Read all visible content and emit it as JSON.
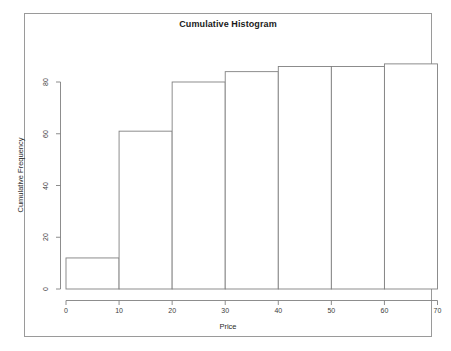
{
  "chart_data": {
    "type": "bar",
    "title": "Cumulative Histogram",
    "xlabel": "Price",
    "ylabel": "Cumulative Frequency",
    "subtitle": "",
    "grid": false,
    "legend": false,
    "legend_position": "none",
    "style": "R base graphics cumulative histogram (outlined bars, no fill)",
    "bin_width": 10,
    "bin_edges": [
      0,
      10,
      20,
      30,
      40,
      50,
      60,
      70
    ],
    "categories": [
      "0-10",
      "10-20",
      "20-30",
      "30-40",
      "40-50",
      "50-60",
      "60-70"
    ],
    "values": [
      12,
      61,
      80,
      84,
      86,
      86,
      87
    ],
    "x": [
      5,
      15,
      25,
      35,
      45,
      55,
      65
    ],
    "xlim": [
      0,
      70
    ],
    "ylim": [
      0,
      88
    ],
    "xticks": [
      0,
      10,
      20,
      30,
      40,
      50,
      60,
      70
    ],
    "xticklabels": [
      "0",
      "10",
      "20",
      "30",
      "40",
      "50",
      "60",
      "70"
    ],
    "yticks": [
      0,
      20,
      40,
      60,
      80
    ],
    "yticklabels": [
      "0",
      "20",
      "40",
      "60",
      "80"
    ],
    "bar_edge_color": "#808080",
    "bar_fill_color": "#ffffff",
    "axis_color": "#808080",
    "background_color": "#ffffff",
    "frame_color": "#9a9a9a"
  }
}
